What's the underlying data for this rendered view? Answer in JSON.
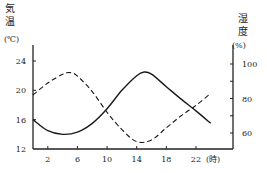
{
  "chart_data": {
    "type": "line",
    "title": "",
    "xlabel": "(時)",
    "ylabel_left": [
      "気",
      "温",
      "(℃)"
    ],
    "ylabel_right": [
      "湿",
      "度",
      "(%)"
    ],
    "x_ticks": [
      2,
      6,
      10,
      14,
      18,
      22
    ],
    "y_left_ticks": [
      12,
      16,
      20,
      24
    ],
    "y_right_ticks": [
      60,
      80,
      100
    ],
    "xlim": [
      0,
      27
    ],
    "ylim_left": [
      12,
      26
    ],
    "ylim_right": [
      50,
      110
    ],
    "grid": false,
    "legend": "none",
    "series": [
      {
        "name": "気温",
        "axis": "left",
        "style": "solid",
        "x": [
          0,
          2,
          4,
          6,
          8,
          10,
          12,
          14,
          15,
          16,
          18,
          20,
          22,
          24
        ],
        "values": [
          16,
          14.5,
          14,
          14.3,
          15.5,
          17.5,
          20,
          22,
          22.5,
          22.2,
          20.5,
          18.8,
          17.2,
          15.5
        ]
      },
      {
        "name": "湿度",
        "axis": "right",
        "style": "dashed",
        "x": [
          0,
          2,
          4,
          5,
          6,
          8,
          10,
          12,
          14,
          16,
          18,
          20,
          22,
          24
        ],
        "values": [
          82,
          89,
          94,
          95,
          93,
          84,
          72,
          62,
          55,
          56,
          63,
          70,
          76,
          83
        ]
      }
    ]
  },
  "labels": {
    "left_unit": "(℃)",
    "right_unit": "(%)",
    "x_unit": "(時)",
    "left_title_1": "気",
    "left_title_2": "温",
    "right_title_1": "湿",
    "right_title_2": "度"
  }
}
